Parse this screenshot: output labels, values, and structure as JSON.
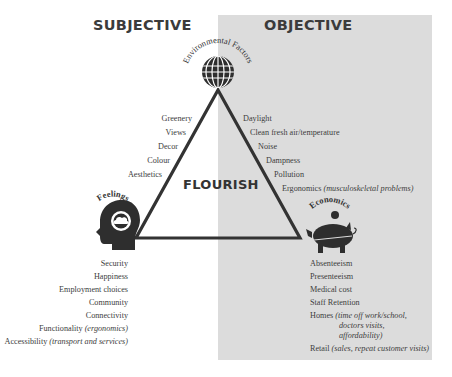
{
  "headings": {
    "subjective": "SUBJECTIVE",
    "objective": "OBJECTIVE"
  },
  "center_label": "FLOURISH",
  "nodes": {
    "environmental": {
      "title": "Environmental Factors",
      "icon": "globe-icon"
    },
    "feelings": {
      "title": "Feelings",
      "icon": "head-cloud-icon"
    },
    "economics": {
      "title": "Economics",
      "icon": "piggy-bank-icon"
    }
  },
  "environmental_subjective": [
    "Greenery",
    "Views",
    "Decor",
    "Colour",
    "Aesthetics"
  ],
  "environmental_objective": [
    {
      "text": "Daylight",
      "note": ""
    },
    {
      "text": "Clean fresh air/temperature",
      "note": ""
    },
    {
      "text": "Noise",
      "note": ""
    },
    {
      "text": "Dampness",
      "note": ""
    },
    {
      "text": "Pollution",
      "note": ""
    },
    {
      "text": "Ergonomics ",
      "note": "(musculoskeletal problems)"
    }
  ],
  "feelings_items": [
    {
      "text": "Security",
      "note": ""
    },
    {
      "text": "Happiness",
      "note": ""
    },
    {
      "text": "Employment choices",
      "note": ""
    },
    {
      "text": "Community",
      "note": ""
    },
    {
      "text": "Connectivity",
      "note": ""
    },
    {
      "text": "Functionality ",
      "note": "(ergonomics)"
    },
    {
      "text": "Accessibility ",
      "note": "(transport and services)"
    }
  ],
  "economics_items": [
    {
      "text": "Absenteeism",
      "note": ""
    },
    {
      "text": "Presenteeism",
      "note": ""
    },
    {
      "text": "Medical cost",
      "note": ""
    },
    {
      "text": "Staff Retention",
      "note": ""
    },
    {
      "text": "Homes ",
      "note": "(time off work/school,"
    },
    {
      "text": "",
      "note": "doctors visits,"
    },
    {
      "text": "",
      "note": "affordability)"
    },
    {
      "text": "Retail ",
      "note": "(sales, repeat customer visits)"
    }
  ],
  "colors": {
    "objective_panel": "#dcdcdc",
    "ink": "#333333"
  }
}
